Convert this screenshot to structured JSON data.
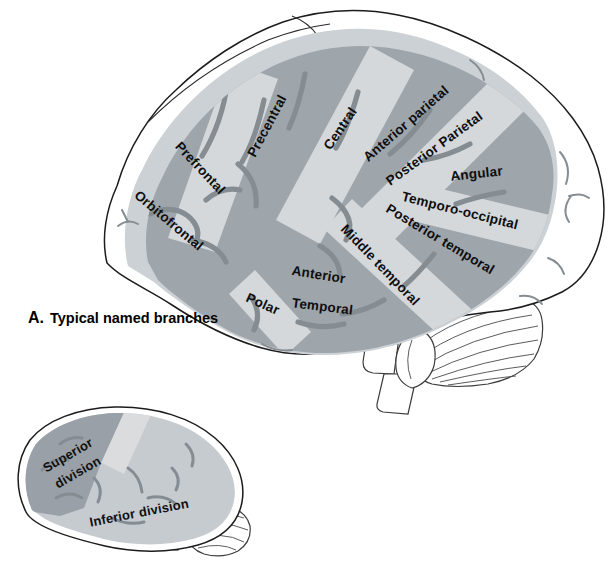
{
  "panel": {
    "label": "A.",
    "caption": "Typical named branches"
  },
  "colors": {
    "territory_dark": "#9ea5ab",
    "territory_light": "#d5d8da",
    "territory_rim": "#ccd1d5",
    "sulcus": "#858d93",
    "superior_division": "#99a0a7",
    "inferior_division": "#c6cbd0",
    "division_gap": "#dadcde"
  },
  "large_brain": {
    "labels": [
      {
        "id": "orbitofrontal",
        "text": "Orbitofrontal"
      },
      {
        "id": "prefrontal",
        "text": "Prefrontal"
      },
      {
        "id": "precentral",
        "text": "Precentral"
      },
      {
        "id": "central",
        "text": "Central"
      },
      {
        "id": "anterior-parietal",
        "text": "Anterior parietal"
      },
      {
        "id": "posterior-parietal",
        "text": "Posterior Parietal"
      },
      {
        "id": "angular",
        "text": "Angular"
      },
      {
        "id": "temporo-occipital",
        "text": "Temporo-occipital"
      },
      {
        "id": "posterior-temporal",
        "text": "Posterior temporal"
      },
      {
        "id": "middle-temporal",
        "text": "Middle temporal"
      },
      {
        "id": "anterior-temporal-line1",
        "text": "Anterior"
      },
      {
        "id": "anterior-temporal-line2",
        "text": "Temporal"
      },
      {
        "id": "polar",
        "text": "Polar"
      }
    ]
  },
  "small_brain": {
    "labels": [
      "Superior",
      "division",
      "Inferior division"
    ]
  }
}
